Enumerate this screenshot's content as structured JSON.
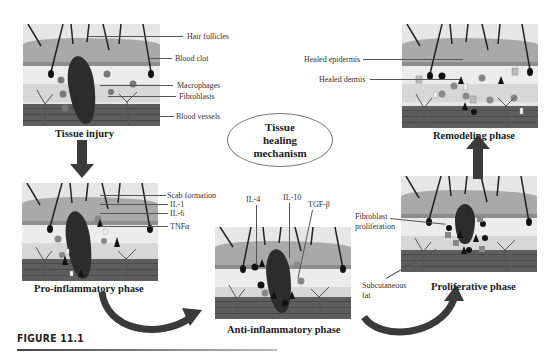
{
  "figure": {
    "caption": "FIGURE 11.1",
    "center_label": [
      "Tissue",
      "healing",
      "mechanism"
    ]
  },
  "panels": {
    "tissue_injury": {
      "title": "Tissue injury",
      "labels": [
        "Hair follicles",
        "Blood clot",
        "Macrophages",
        "Fibroblasts",
        "Blood vessels"
      ]
    },
    "pro_inflammatory": {
      "title": "Pro-inflammatory phase",
      "labels": [
        "Scab formation",
        "IL-1",
        "IL-6",
        "TNFα"
      ]
    },
    "anti_inflammatory": {
      "title": "Anti-inflammatory phase",
      "labels": [
        "IL-4",
        "IL-10",
        "TGF-β"
      ]
    },
    "proliferative": {
      "title": "Proliferative phase",
      "labels": [
        "Fibroblast",
        "proliferation",
        "Subcutaneous",
        "fat"
      ]
    },
    "remodeling": {
      "title": "Remodeling phase",
      "labels": [
        "Healed epidermis",
        "Healed dermis"
      ]
    }
  },
  "colors": {
    "arrow": "#3a3a3a",
    "epidermis": "#a9a9a9",
    "dermis": "#ececec",
    "subcutaneous": "#5e5e5e",
    "clot": "#2c2c2c"
  }
}
